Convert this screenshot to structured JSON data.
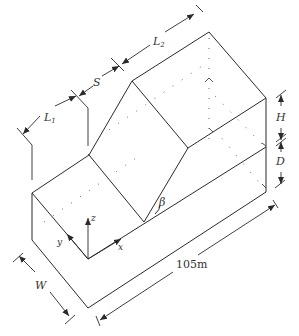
{
  "figure": {
    "type": "isometric slope geometry diagram",
    "labels": {
      "L1": "L",
      "L1_sub": "1",
      "S": "S",
      "L2": "L",
      "L2_sub": "2",
      "H": "H",
      "D": "D",
      "W": "W",
      "beta": "β",
      "length": "105m"
    },
    "axes": {
      "x": "x",
      "y": "y",
      "z": "z"
    },
    "colors": {
      "line": "#2a2a2a",
      "text": "#333333",
      "background": "#ffffff"
    }
  }
}
